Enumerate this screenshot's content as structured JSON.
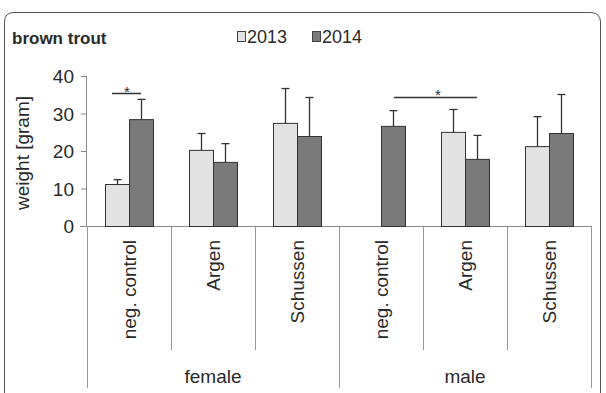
{
  "chart_data": {
    "type": "bar",
    "title": "brown trout",
    "xlabel": "",
    "ylabel": "weight [gram]",
    "ylim": [
      0,
      40
    ],
    "yticks": [
      0,
      10,
      20,
      30,
      40
    ],
    "grid": false,
    "legend_position": "top",
    "groups": [
      {
        "name": "female",
        "categories": [
          "neg. control",
          "Argen",
          "Schussen"
        ]
      },
      {
        "name": "male",
        "categories": [
          "neg. control",
          "Argen",
          "Schussen"
        ]
      }
    ],
    "categories": [
      "female / neg. control",
      "female / Argen",
      "female / Schussen",
      "male / neg. control",
      "male / Argen",
      "male / Schussen"
    ],
    "series": [
      {
        "name": "2013",
        "color": "#e2e2e2",
        "values": [
          11.2,
          20.3,
          27.5,
          null,
          25.1,
          21.3
        ],
        "error_upper": [
          12.5,
          24.8,
          36.8,
          null,
          31.2,
          29.3
        ]
      },
      {
        "name": "2014",
        "color": "#7a7a7a",
        "values": [
          28.5,
          17.1,
          24.0,
          26.7,
          17.9,
          24.8
        ],
        "error_upper": [
          33.9,
          22.1,
          34.4,
          30.9,
          24.3,
          35.2
        ]
      }
    ],
    "annotations": [
      {
        "text": "*",
        "between": [
          "female / neg. control 2013",
          "female / neg. control 2014"
        ]
      },
      {
        "text": "*",
        "between": [
          "male / neg. control 2014",
          "male / Argen 2014"
        ]
      }
    ]
  },
  "labels": {
    "title": "brown trout",
    "legend_2013": "2013",
    "legend_2014": "2014",
    "ylabel": "weight [gram]",
    "ytick_0": "0",
    "ytick_10": "10",
    "ytick_20": "20",
    "ytick_30": "30",
    "ytick_40": "40",
    "cat_f1": "neg. control",
    "cat_f2": "Argen",
    "cat_f3": "Schussen",
    "cat_m1": "neg. control",
    "cat_m2": "Argen",
    "cat_m3": "Schussen",
    "group_female": "female",
    "group_male": "male",
    "sig_1": "*",
    "sig_2": "*"
  }
}
